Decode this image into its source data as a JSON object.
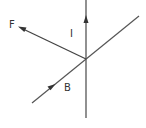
{
  "diagram": {
    "title": "",
    "type": "vector-diagram",
    "colors": {
      "line": "#555555",
      "text": "#333333",
      "background": "#ffffff"
    },
    "vectors": [
      {
        "id": "current",
        "label": "I",
        "description": "Current direction, vertical upward",
        "from": [
          86,
          118
        ],
        "to": [
          86,
          0
        ],
        "arrowhead_at": [
          86,
          17
        ],
        "arrow_direction": "up"
      },
      {
        "id": "field",
        "label": "B",
        "description": "Magnetic field direction, diagonal up-right",
        "from": [
          32,
          103
        ],
        "to": [
          139,
          16
        ],
        "arrowhead_at": [
          54,
          85
        ],
        "arrow_direction": "up-right"
      },
      {
        "id": "force",
        "label": "F",
        "description": "Force direction, toward upper-left",
        "from": [
          86,
          59
        ],
        "to": [
          19,
          27
        ],
        "arrowhead_at": [
          19,
          27
        ],
        "arrow_direction": "up-left"
      }
    ],
    "intersection": [
      86,
      59
    ],
    "labels": {
      "F": "F",
      "I": "I",
      "B": "B"
    }
  }
}
